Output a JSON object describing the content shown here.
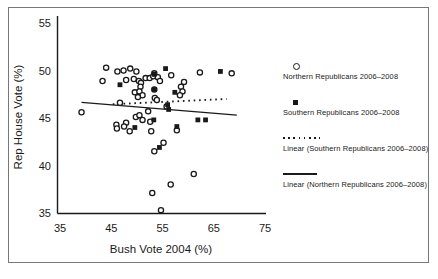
{
  "figure": {
    "background": "#ffffff",
    "frame_color": "#777777",
    "ink_color": "#1a1a1a"
  },
  "legend": {
    "items": [
      {
        "marker": "open-circle",
        "label": "Northern Republicans 2006–2008"
      },
      {
        "marker": "filled-square",
        "label": "Southern Republicans 2006–2008"
      },
      {
        "marker": "dotted-line",
        "label": "Linear (Southern Republicans 2006–2008)"
      },
      {
        "marker": "solid-line",
        "label": "Linear (Northern Republicans 2006–2008)"
      }
    ]
  },
  "chart_data": {
    "type": "scatter",
    "title": "",
    "xlabel": "Bush Vote 2004 (%)",
    "ylabel": "Rep House Vote (%)",
    "xlim": [
      35,
      75
    ],
    "ylim": [
      35,
      55
    ],
    "x_ticks": [
      35,
      45,
      55,
      65,
      75
    ],
    "y_ticks": [
      35,
      40,
      45,
      50,
      55
    ],
    "grid": false,
    "legend_position": "right",
    "marker_color": "#1a1a1a",
    "series": [
      {
        "name": "Northern Republicans 2006–2008",
        "marker": "open-circle",
        "points": [
          [
            44.0,
            50.3
          ],
          [
            46.2,
            49.9
          ],
          [
            47.4,
            50.0
          ],
          [
            48.7,
            50.2
          ],
          [
            49.9,
            49.9
          ],
          [
            43.3,
            48.9
          ],
          [
            47.9,
            49.0
          ],
          [
            49.4,
            49.1
          ],
          [
            50.4,
            48.9
          ],
          [
            51.7,
            49.2
          ],
          [
            52.5,
            49.2
          ],
          [
            53.2,
            49.4
          ],
          [
            54.1,
            49.3
          ],
          [
            54.5,
            48.9
          ],
          [
            53.4,
            49.7
          ],
          [
            50.8,
            48.7
          ],
          [
            50.7,
            48.3
          ],
          [
            53.4,
            48.0
          ],
          [
            49.6,
            47.7
          ],
          [
            50.5,
            47.8
          ],
          [
            51.1,
            47.4
          ],
          [
            50.2,
            47.2
          ],
          [
            53.5,
            47.1
          ],
          [
            53.9,
            46.9
          ],
          [
            56.7,
            49.5
          ],
          [
            62.3,
            49.8
          ],
          [
            68.5,
            49.7
          ],
          [
            59.2,
            48.8
          ],
          [
            58.6,
            48.3
          ],
          [
            58.9,
            47.8
          ],
          [
            58.4,
            47.4
          ],
          [
            55.8,
            46.2
          ],
          [
            46.7,
            46.6
          ],
          [
            39.2,
            45.6
          ],
          [
            52.2,
            45.7
          ],
          [
            49.8,
            45.1
          ],
          [
            50.5,
            45.3
          ],
          [
            51.1,
            44.8
          ],
          [
            47.9,
            44.5
          ],
          [
            47.5,
            44.1
          ],
          [
            46.0,
            44.3
          ],
          [
            46.1,
            43.9
          ],
          [
            48.6,
            43.6
          ],
          [
            52.6,
            44.6
          ],
          [
            52.8,
            43.6
          ],
          [
            57.8,
            43.7
          ],
          [
            55.2,
            42.4
          ],
          [
            53.4,
            41.5
          ],
          [
            61.1,
            39.1
          ],
          [
            56.6,
            38.0
          ],
          [
            53.0,
            37.1
          ],
          [
            54.7,
            35.3
          ]
        ]
      },
      {
        "name": "Southern Republicans 2006–2008",
        "marker": "filled-square",
        "points": [
          [
            46.7,
            48.5
          ],
          [
            55.6,
            50.2
          ],
          [
            66.3,
            49.9
          ],
          [
            53.4,
            49.6
          ],
          [
            53.4,
            48.0
          ],
          [
            57.4,
            47.7
          ],
          [
            56.0,
            46.4
          ],
          [
            56.2,
            45.9
          ],
          [
            53.3,
            44.8
          ],
          [
            49.6,
            44.0
          ],
          [
            57.8,
            44.1
          ],
          [
            61.9,
            44.8
          ],
          [
            63.4,
            44.8
          ],
          [
            54.4,
            41.9
          ]
        ]
      },
      {
        "name": "Linear (Southern Republicans 2006–2008)",
        "marker": "dotted-line",
        "endpoints": [
          [
            45.3,
            46.45
          ],
          [
            67.5,
            47.0
          ]
        ]
      },
      {
        "name": "Linear (Northern Republicans 2006–2008)",
        "marker": "solid-line",
        "endpoints": [
          [
            39.2,
            46.65
          ],
          [
            69.5,
            45.3
          ]
        ]
      }
    ]
  }
}
